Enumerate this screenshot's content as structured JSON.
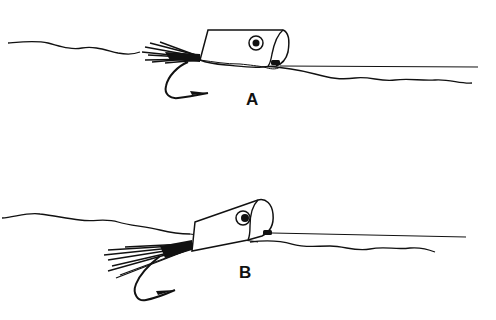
{
  "figures": [
    {
      "id": "A",
      "label": "A",
      "description": "Popper lure floating on water surface, tail feathers and hook held level"
    },
    {
      "id": "B",
      "label": "B",
      "description": "Popper lure tilted nose-up, tail feathers and hook hanging below water surface"
    }
  ],
  "colors": {
    "ink": "#111111",
    "background": "#ffffff"
  }
}
